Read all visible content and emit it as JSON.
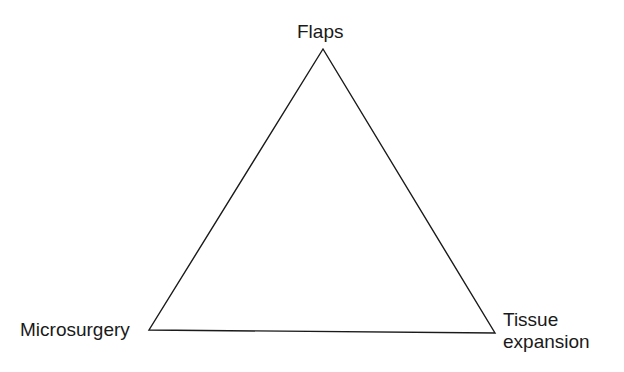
{
  "diagram": {
    "type": "triangle",
    "vertices": {
      "top": {
        "label": "Flaps",
        "x": 323,
        "y": 49
      },
      "bottom_left": {
        "label": "Microsurgery",
        "x": 149,
        "y": 330
      },
      "bottom_right": {
        "label_line1": "Tissue",
        "label_line2": "expansion",
        "x": 495,
        "y": 333
      }
    },
    "stroke_color": "#1a1a1a",
    "background_color": "#ffffff"
  }
}
